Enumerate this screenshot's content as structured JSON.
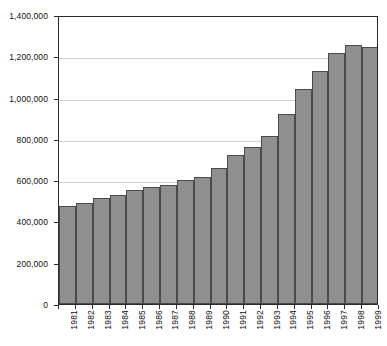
{
  "chart_data": {
    "type": "bar",
    "title": "",
    "subtitle": "",
    "xlabel": "",
    "ylabel": "",
    "categories": [
      "1981",
      "1982",
      "1983",
      "1984",
      "1985",
      "1986",
      "1987",
      "1988",
      "1989",
      "1990",
      "1991",
      "1992",
      "1993",
      "1994",
      "1995",
      "1996",
      "1997",
      "1998",
      "1999"
    ],
    "values": [
      475000,
      490000,
      515000,
      530000,
      550000,
      565000,
      575000,
      600000,
      615000,
      660000,
      720000,
      760000,
      815000,
      920000,
      1040000,
      1130000,
      1215000,
      1255000,
      1245000
    ],
    "ylim": [
      0,
      1400000
    ],
    "yticks": [
      0,
      200000,
      400000,
      600000,
      800000,
      1000000,
      1200000,
      1400000
    ],
    "ytick_labels": [
      "0",
      "200,000",
      "400,000",
      "600,000",
      "800,000",
      "1,000,000",
      "1,200,000",
      "1,400,000"
    ],
    "grid": true,
    "grid_axis": "y",
    "legend": false,
    "legend_position": "none",
    "series": [
      {
        "name": "",
        "values": [
          475000,
          490000,
          515000,
          530000,
          550000,
          565000,
          575000,
          600000,
          615000,
          660000,
          720000,
          760000,
          815000,
          920000,
          1040000,
          1130000,
          1215000,
          1255000,
          1245000
        ]
      }
    ],
    "colors": {
      "bar_fill": "#8f8f8f",
      "bar_edge": "#4a4a4a",
      "axis": "#2b2b2b",
      "gridline": "#a8a8a8",
      "background": "#ffffff",
      "text": "#111111"
    }
  }
}
